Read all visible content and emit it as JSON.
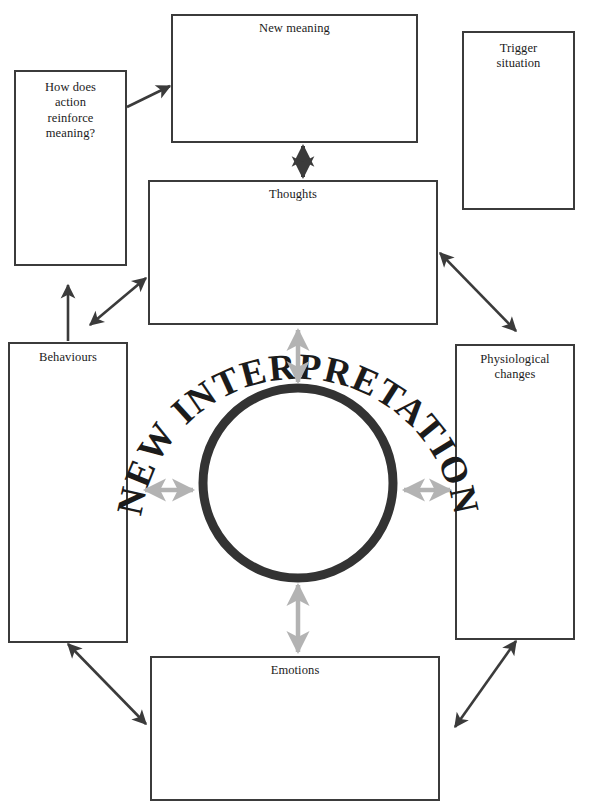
{
  "diagram": {
    "title": "NEW INTERPRETATION",
    "center_label": "NEW INTERPRETATION",
    "colors": {
      "box_border": "#3b3b3b",
      "circle": "#333333",
      "dark_arrow": "#3b3b3b",
      "grey_arrow": "#b3b3b3",
      "text": "#1b1b1b",
      "background": "#ffffff"
    },
    "boxes": {
      "new_meaning": {
        "label": "New meaning",
        "value": ""
      },
      "trigger_situation": {
        "label": "Trigger\nsituation",
        "line1": "Trigger",
        "line2": "situation",
        "value": ""
      },
      "how_does_action": {
        "label": "How does action reinforce meaning?",
        "line1": "How does",
        "line2": "action",
        "line3": "reinforce",
        "line4": "meaning?",
        "value": ""
      },
      "thoughts": {
        "label": "Thoughts",
        "value": ""
      },
      "behaviours": {
        "label": "Behaviours",
        "value": ""
      },
      "physiological_changes": {
        "label": "Physiological changes",
        "line1": "Physiological",
        "line2": "changes",
        "value": ""
      },
      "emotions": {
        "label": "Emotions",
        "value": ""
      }
    },
    "connectors": [
      {
        "name": "how-does-action-to-new-meaning",
        "style": "single-head",
        "color": "#3b3b3b"
      },
      {
        "name": "new-meaning-to-thoughts",
        "style": "double-head",
        "color": "#3b3b3b"
      },
      {
        "name": "thoughts-to-physiological",
        "style": "double-head",
        "color": "#3b3b3b"
      },
      {
        "name": "thoughts-to-behaviours-diagonal",
        "style": "double-head",
        "color": "#3b3b3b"
      },
      {
        "name": "behaviours-to-thoughts-vertical",
        "style": "single-head",
        "color": "#3b3b3b"
      },
      {
        "name": "behaviours-to-emotions",
        "style": "double-head",
        "color": "#3b3b3b"
      },
      {
        "name": "physiological-to-emotions",
        "style": "double-head",
        "color": "#3b3b3b"
      },
      {
        "name": "circle-to-thoughts",
        "style": "double-head",
        "color": "#b3b3b3"
      },
      {
        "name": "circle-to-emotions",
        "style": "double-head",
        "color": "#b3b3b3"
      },
      {
        "name": "circle-to-behaviours",
        "style": "double-head",
        "color": "#b3b3b3"
      },
      {
        "name": "circle-to-physiological",
        "style": "double-head",
        "color": "#b3b3b3"
      }
    ]
  }
}
